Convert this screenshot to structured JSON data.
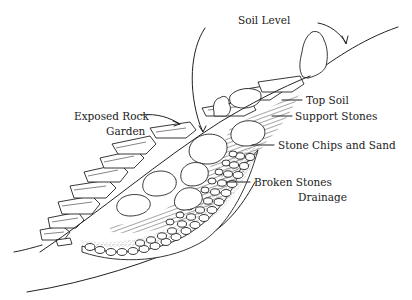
{
  "diagram": {
    "labels": {
      "soil_level": "Soil Level",
      "exposed_rock_line1": "Exposed Rock",
      "exposed_rock_line2": "Garden",
      "top_soil": "Top Soil",
      "support_stones": "Support Stones",
      "stone_chips": "Stone Chips and Sand",
      "broken_stones": "Broken Stones",
      "drainage": "Drainage"
    },
    "colors": {
      "line": "#222222",
      "background": "#ffffff"
    }
  }
}
